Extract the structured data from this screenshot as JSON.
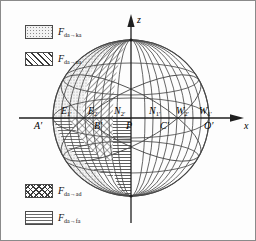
{
  "figure": {
    "axes": {
      "vertical": {
        "name": "z-axis",
        "label": "z"
      },
      "horizontal": {
        "name": "x-axis",
        "label": "x"
      }
    },
    "colors": {
      "outline": "#3a3a3a",
      "axis": "#2b2b2b",
      "dotted_fill": "#f2f2f2",
      "hatch_stroke": "#3a3a3a",
      "horizontal_fill": "#6a6a6a",
      "background": "#fdfdfd",
      "border": "#8a8a8a"
    }
  },
  "legend": {
    "entries": [
      {
        "pattern": "dotted",
        "symbol": "F",
        "subscript": "da→ka",
        "label": "F",
        "sub": "da→ka"
      },
      {
        "pattern": "diagonal",
        "symbol": "F",
        "subscript": "da→ua",
        "label": "F",
        "sub": "da→ua"
      },
      {
        "pattern": "checkered",
        "symbol": "F",
        "subscript": "da→ad",
        "label": "F",
        "sub": "da→ad"
      },
      {
        "pattern": "horizontal",
        "symbol": "F",
        "subscript": "da→fa",
        "label": "F",
        "sub": "da→fa"
      }
    ]
  },
  "points": {
    "upper_row": [
      {
        "id": "E1",
        "label": "E",
        "sub": "1′"
      },
      {
        "id": "E2",
        "label": "E",
        "sub": "2′"
      },
      {
        "id": "N2",
        "label": "N",
        "sub": "2′"
      },
      {
        "id": "N1",
        "label": "N",
        "sub": "1′"
      },
      {
        "id": "W2",
        "label": "W",
        "sub": "2′"
      },
      {
        "id": "W1",
        "label": "W",
        "sub": "1′"
      }
    ],
    "axis_row": [
      {
        "id": "A",
        "label": "A′"
      },
      {
        "id": "B",
        "label": "B′"
      },
      {
        "id": "P",
        "label": "P"
      },
      {
        "id": "C",
        "label": "C′"
      },
      {
        "id": "O",
        "label": "O′"
      }
    ]
  }
}
